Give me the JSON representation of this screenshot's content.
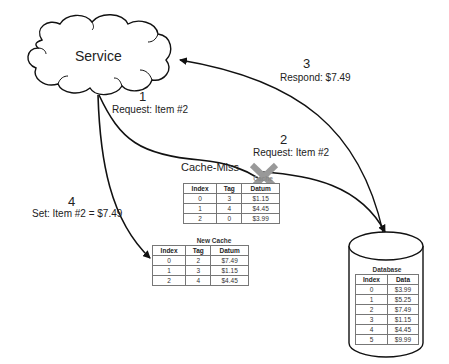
{
  "service": {
    "label": "Service"
  },
  "steps": [
    {
      "number": "1",
      "text": "Request: Item #2"
    },
    {
      "number": "2",
      "text": "Request: Item #2"
    },
    {
      "number": "3",
      "text": "Respond: $7.49"
    },
    {
      "number": "4",
      "text": "Set: Item #2 = $7.49"
    }
  ],
  "cache_miss": {
    "label": "Cache-Miss",
    "icon": "x-mark",
    "color": "#999999"
  },
  "cache": {
    "title": "Cache",
    "headers": [
      "Index",
      "Tag",
      "Datum"
    ],
    "rows": [
      [
        "0",
        "3",
        "$1.15"
      ],
      [
        "1",
        "4",
        "$4.45"
      ],
      [
        "2",
        "0",
        "$3.99"
      ]
    ]
  },
  "new_cache": {
    "title": "New Cache",
    "headers": [
      "Index",
      "Tag",
      "Datum"
    ],
    "rows": [
      [
        "0",
        "2",
        "$7.49"
      ],
      [
        "1",
        "3",
        "$1.15"
      ],
      [
        "2",
        "4",
        "$4.45"
      ]
    ]
  },
  "database": {
    "title": "Database",
    "headers": [
      "Index",
      "Data"
    ],
    "rows": [
      [
        "0",
        "$3.99"
      ],
      [
        "1",
        "$5.25"
      ],
      [
        "2",
        "$7.49"
      ],
      [
        "3",
        "$1.15"
      ],
      [
        "4",
        "$4.45"
      ],
      [
        "5",
        "$9.99"
      ]
    ]
  }
}
